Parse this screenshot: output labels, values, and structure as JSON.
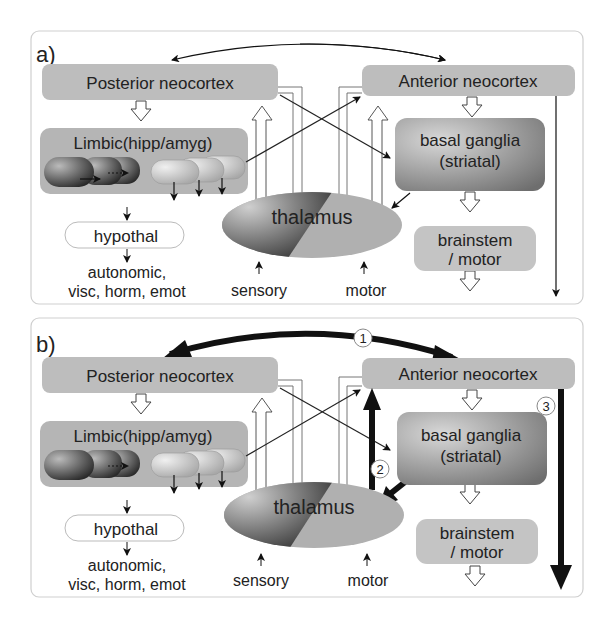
{
  "panels": [
    {
      "id": "a",
      "label": "a)",
      "posterior": "Posterior neocortex",
      "anterior": "Anterior neocortex",
      "limbic": "Limbic(hipp/amyg)",
      "basal1": "basal ganglia",
      "basal2": "(striatal)",
      "hypothal": "hypothal",
      "out1": "autonomic,",
      "out2": "visc, horm, emot",
      "thalamus": "thalamus",
      "sensory": "sensory",
      "motor": "motor",
      "brainstem1": "brainstem",
      "brainstem2": "/ motor"
    },
    {
      "id": "b",
      "label": "b)",
      "posterior": "Posterior neocortex",
      "anterior": "Anterior neocortex",
      "limbic": "Limbic(hipp/amyg)",
      "basal1": "basal ganglia",
      "basal2": "(striatal)",
      "hypothal": "hypothal",
      "out1": "autonomic,",
      "out2": "visc, horm, emot",
      "thalamus": "thalamus",
      "sensory": "sensory",
      "motor": "motor",
      "brainstem1": "brainstem",
      "brainstem2": "/ motor",
      "markers": [
        "1",
        "2",
        "3"
      ]
    }
  ],
  "colors": {
    "box": "#bdbdbd",
    "dark_box": "#8a8a8a",
    "border": "#cfcfcf",
    "arrow": "#111111"
  }
}
